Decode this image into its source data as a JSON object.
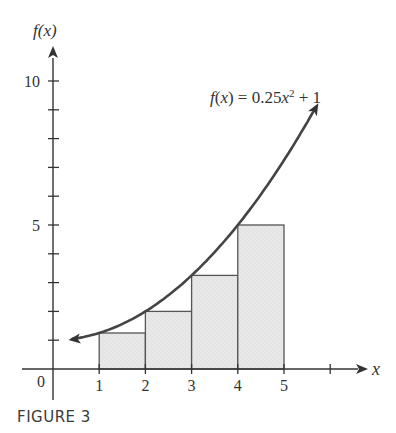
{
  "chart_data": {
    "type": "bar",
    "title": "",
    "caption": "FIGURE 3",
    "xlabel": "x",
    "ylabel": "f(x)",
    "function_label": "f(x) = 0.25x² + 1",
    "function": {
      "a": 0.25,
      "b": 0,
      "c": 1
    },
    "categories": [
      "[1,2]",
      "[2,3]",
      "[3,4]",
      "[4,5]"
    ],
    "rectangles": [
      {
        "x0": 1,
        "x1": 2,
        "height": 1.25
      },
      {
        "x0": 2,
        "x1": 3,
        "height": 2
      },
      {
        "x0": 3,
        "x1": 4,
        "height": 3.25
      },
      {
        "x0": 4,
        "x1": 5,
        "height": 5
      }
    ],
    "values": [
      1.25,
      2,
      3.25,
      5
    ],
    "x_ticks": [
      1,
      2,
      3,
      4,
      5,
      6
    ],
    "x_tick_labels": [
      "1",
      "2",
      "3",
      "4",
      "5"
    ],
    "y_ticks": [
      1,
      2,
      3,
      4,
      5,
      6,
      7,
      8,
      9,
      10
    ],
    "y_tick_labels": [
      "5",
      "10"
    ],
    "origin_label": "0",
    "xlim": [
      0,
      6.8
    ],
    "ylim": [
      0,
      11
    ],
    "curve_domain": [
      0.4,
      5.7
    ],
    "grid": false,
    "colors": {
      "bar_fill": "#e6e6e6",
      "bar_edge": "#555555",
      "curve": "#444444",
      "axis": "#333333"
    }
  },
  "labels": {
    "y_axis": "f(x)",
    "x_axis": "x",
    "origin": "0",
    "function": "f(x) = 0.25x² + 1",
    "caption": "FIGURE 3"
  }
}
